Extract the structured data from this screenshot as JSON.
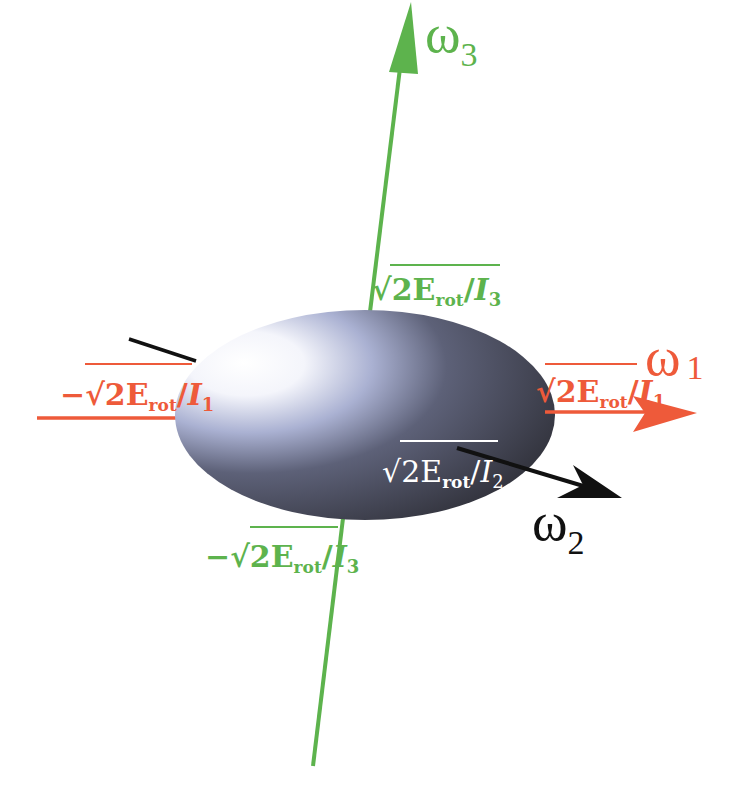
{
  "diagram": {
    "colors": {
      "omega1_axis": "#ee5a3a",
      "omega2_axis": "#111111",
      "omega3_axis": "#5db34d",
      "ellipsoid_highlight": "#ffffff",
      "ellipsoid_mid": "#9aa3c8",
      "ellipsoid_dark": "#3b3d4b",
      "background": "#ffffff"
    },
    "axes": {
      "omega1": {
        "symbol": "ω",
        "subscript": "1"
      },
      "omega2": {
        "symbol": "ω",
        "subscript": "2"
      },
      "omega3": {
        "symbol": "ω",
        "subscript": "3"
      }
    },
    "intercepts": {
      "omega1_pos": {
        "sign": "",
        "text": "2E",
        "sub": "rot",
        "den": "I",
        "den_sub": "1"
      },
      "omega1_neg": {
        "sign": "−",
        "text": "2E",
        "sub": "rot",
        "den": "I",
        "den_sub": "1"
      },
      "omega2_pos": {
        "sign": "",
        "text": "2E",
        "sub": "rot",
        "den": "I",
        "den_sub": "2"
      },
      "omega3_pos": {
        "sign": "",
        "text": "2E",
        "sub": "rot",
        "den": "I",
        "den_sub": "3"
      },
      "omega3_neg": {
        "sign": "−",
        "text": "2E",
        "sub": "rot",
        "den": "I",
        "den_sub": "3"
      }
    },
    "sqrt_symbol": "√",
    "slash": "/"
  },
  "caption": {
    "text": "(cut off caption text – illegible)"
  }
}
